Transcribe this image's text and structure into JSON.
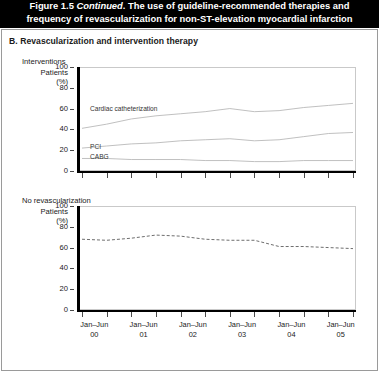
{
  "header": {
    "figure_number": "Figure 1.5",
    "continued": "Continued",
    "title_line1": "Figure 1.5 Continued. The use of guideline-recommended therapies and",
    "title_line2": "frequency of revascularization for non-ST-elevation myocardial infarction",
    "title_prefix": "Figure 1.5 ",
    "title_rest": ". The use of guideline-recommended therapies and",
    "background_color": "#000000",
    "text_color": "#ffffff"
  },
  "panel": {
    "label": "B. Revascularization and intervention therapy"
  },
  "axis_label": {
    "line1": "Patients",
    "line2": "(%)"
  },
  "chart_data": [
    {
      "id": "interventions",
      "type": "line",
      "title": "Interventions",
      "xlabel": "",
      "ylabel": "Patients (%)",
      "ylim": [
        0,
        100
      ],
      "yticks": [
        0,
        20,
        40,
        60,
        80,
        100
      ],
      "grid": false,
      "legend": "inline-labels",
      "x": [
        "Jan-Jun 00",
        "Jul-Dec 00",
        "Jan-Jun 01",
        "Jul-Dec 01",
        "Jan-Jun 02",
        "Jul-Dec 02",
        "Jan-Jun 03",
        "Jul-Dec 03",
        "Jan-Jun 04",
        "Jul-Dec 04",
        "Jan-Jun 05",
        "Jul-Dec 05"
      ],
      "tick_labels": [
        "Jan–Jun 00",
        "Jan–Jun 01",
        "Jan–Jun 02",
        "Jan–Jun 03",
        "Jan–Jun 04",
        "Jan–Jun 05"
      ],
      "series": [
        {
          "name": "Cardiac catheterization",
          "label": "Cardiac catheterization",
          "style": "solid",
          "color": "#b9b9b9",
          "values": [
            42,
            46,
            51,
            54,
            56,
            58,
            61,
            58,
            59,
            62,
            64,
            66
          ]
        },
        {
          "name": "PCI",
          "label": "PCI",
          "style": "solid",
          "color": "#b9b9b9",
          "values": [
            23,
            25,
            27,
            28,
            30,
            31,
            32,
            30,
            31,
            34,
            37,
            38
          ]
        },
        {
          "name": "CABG",
          "label": "CABG",
          "style": "solid",
          "color": "#b9b9b9",
          "values": [
            13,
            13,
            12,
            12,
            12,
            11,
            11,
            10,
            10,
            11,
            11,
            11
          ]
        }
      ]
    },
    {
      "id": "no-revascularization",
      "type": "line",
      "title": "No revascularization",
      "xlabel": "",
      "ylabel": "Patients (%)",
      "ylim": [
        0,
        100
      ],
      "yticks": [
        0,
        20,
        40,
        60,
        80,
        100
      ],
      "grid": false,
      "legend": "none",
      "x": [
        "Jan-Jun 00",
        "Jul-Dec 00",
        "Jan-Jun 01",
        "Jul-Dec 01",
        "Jan-Jun 02",
        "Jul-Dec 02",
        "Jan-Jun 03",
        "Jul-Dec 03",
        "Jan-Jun 04",
        "Jul-Dec 04",
        "Jan-Jun 05",
        "Jul-Dec 05"
      ],
      "tick_labels": [
        "Jan–Jun 00",
        "Jan–Jun 01",
        "Jan–Jun 02",
        "Jan–Jun 03",
        "Jan–Jun 04",
        "Jan–Jun 05"
      ],
      "series": [
        {
          "name": "No revascularization",
          "label": "",
          "style": "dashed",
          "color": "#6e6e6e",
          "values": [
            69,
            68,
            70,
            73,
            72,
            69,
            68,
            68,
            62,
            62,
            61,
            60
          ]
        }
      ]
    }
  ]
}
